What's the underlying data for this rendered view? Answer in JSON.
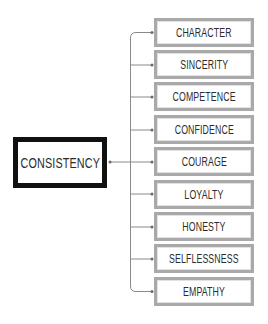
{
  "diagram": {
    "root": {
      "label": "CONSISTENCY"
    },
    "children": [
      {
        "label": "CHARACTER"
      },
      {
        "label": "SINCERITY"
      },
      {
        "label": "COMPETENCE"
      },
      {
        "label": "CONFIDENCE"
      },
      {
        "label": "COURAGE"
      },
      {
        "label": "LOYALTY"
      },
      {
        "label": "HONESTY"
      },
      {
        "label": "SELFLESSNESS"
      },
      {
        "label": "EMPATHY"
      }
    ],
    "colors": {
      "root_border": "#111111",
      "child_border": "#a9a9a9",
      "connector": "#8a8a8a",
      "text": "#2c2c2c"
    }
  }
}
